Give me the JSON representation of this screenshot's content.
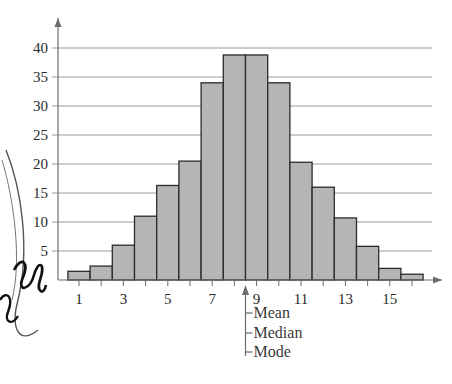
{
  "chart_data": {
    "type": "bar",
    "title": "",
    "xlabel": "",
    "ylabel": "",
    "categories": [
      1,
      2,
      3,
      4,
      5,
      6,
      7,
      8,
      9,
      10,
      11,
      12,
      13,
      14,
      15,
      16
    ],
    "values": [
      1.5,
      2.4,
      6,
      11,
      16.3,
      20.5,
      34,
      38.8,
      38.8,
      34,
      20.3,
      16,
      10.7,
      5.8,
      2,
      1
    ],
    "ylim": [
      0,
      42
    ],
    "xlim": [
      0,
      17
    ],
    "y_ticks": [
      5,
      10,
      15,
      20,
      25,
      30,
      35,
      40
    ],
    "x_tick_labels": [
      1,
      3,
      5,
      7,
      9,
      11,
      13,
      15
    ],
    "grid": "horizontal",
    "bar_fill": "#b5b5b5",
    "bar_stroke": "#2b2b2b",
    "annotation": {
      "x": 8.5,
      "labels": [
        "Mean",
        "Median",
        "Mode"
      ]
    },
    "histogram": true
  },
  "colors": {
    "axis": "#6d6d6d",
    "grid": "#9a9a9a",
    "text": "#2a2a2a"
  }
}
